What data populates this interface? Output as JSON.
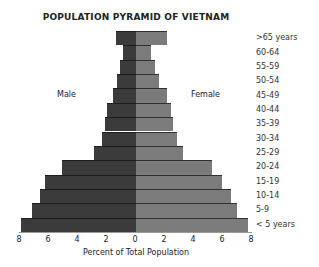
{
  "chart_data": {
    "type": "bar",
    "subtype": "population-pyramid",
    "title": "POPULATION PYRAMID OF VIETNAM",
    "xlabel": "Percent of Total Population",
    "ylabel": "",
    "xlim": [
      -8,
      8
    ],
    "x_ticks": [
      "8",
      "6",
      "4",
      "2",
      "0",
      "2",
      "4",
      "6",
      "8"
    ],
    "categories": [
      ">65 years",
      "60-64",
      "55-59",
      "50-54",
      "45-49",
      "40-44",
      "35-39",
      "30-34",
      "25-29",
      "20-24",
      "15-19",
      "10-14",
      "5-9",
      "< 5 years"
    ],
    "series": [
      {
        "name": "Male",
        "side": "left",
        "color": "#3b3b3b",
        "values": [
          1.4,
          0.9,
          1.1,
          1.3,
          1.6,
          2.0,
          2.1,
          2.3,
          2.9,
          5.1,
          6.2,
          6.6,
          7.1,
          7.9
        ]
      },
      {
        "name": "Female",
        "side": "right",
        "color": "#7b7b7b",
        "values": [
          2.1,
          1.0,
          1.3,
          1.6,
          2.1,
          2.4,
          2.5,
          2.8,
          3.2,
          5.2,
          5.9,
          6.5,
          6.9,
          7.7
        ]
      }
    ],
    "legend": {
      "position": "inline",
      "labels": [
        "Male",
        "Female"
      ]
    },
    "grid": false
  }
}
